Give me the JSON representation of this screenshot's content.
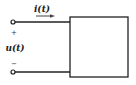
{
  "diagram": {
    "type": "two-terminal network (one-port)",
    "current_label": "i(t)",
    "voltage_label": "u(t)",
    "plus_sign": "+",
    "minus_sign": "−",
    "colors": {
      "stroke": "#222222",
      "background": "#ffffff"
    },
    "elements": {
      "top_terminal": {
        "x": 13,
        "y": 22
      },
      "bottom_terminal": {
        "x": 13,
        "y": 72
      },
      "box": {
        "x": 70,
        "y": 17,
        "width": 58,
        "height": 60
      },
      "current_arrow": {
        "x1": 36,
        "x2": 54,
        "y": 16
      }
    }
  }
}
